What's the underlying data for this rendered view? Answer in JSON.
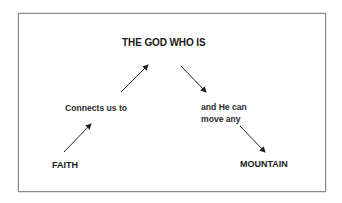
{
  "diagram": {
    "nodes": {
      "top": "THE GOD WHO IS",
      "left_middle": "Connects us to",
      "right_middle": "and He can\nmove any",
      "bottom_left": "FAITH",
      "bottom_right": "MOUNTAIN"
    },
    "arrows": [
      {
        "from": "FAITH",
        "to": "Connects us to",
        "direction": "up-right"
      },
      {
        "from": "Connects us to",
        "to": "THE GOD WHO IS",
        "direction": "up-right"
      },
      {
        "from": "THE GOD WHO IS",
        "to": "and He can move any",
        "direction": "down-right"
      },
      {
        "from": "and He can move any",
        "to": "MOUNTAIN",
        "direction": "down-right"
      }
    ],
    "colors": {
      "text": "#1a1a1a",
      "arrow": "#222222",
      "border": "#8a8a8a",
      "background": "#ffffff"
    }
  }
}
